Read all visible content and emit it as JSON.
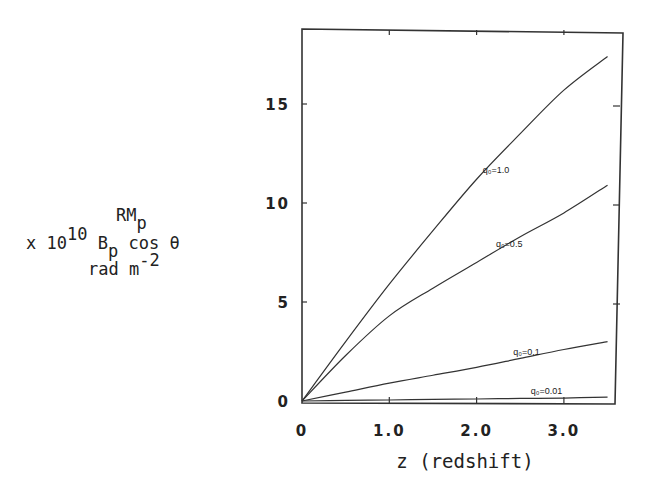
{
  "chart_data": {
    "type": "line",
    "title": "",
    "xlabel": "z (redshift)",
    "ylabel": {
      "line1": "RM",
      "line1_sub": "p",
      "line2_prefix": "x 10",
      "line2_sup": "10",
      "line2_B": "B",
      "line2_B_sub": "p",
      "line2_suffix": "cos θ",
      "line3": "rad m",
      "line3_sup": "-2"
    },
    "xlim": [
      0,
      3.5
    ],
    "ylim": [
      0,
      18.5
    ],
    "x_ticks": [
      0,
      1.0,
      2.0,
      3.0
    ],
    "x_tick_labels": [
      "0",
      "1.0",
      "2.0",
      "3.0"
    ],
    "y_ticks": [
      0,
      5,
      10,
      15
    ],
    "y_tick_labels": [
      "0",
      "5",
      "10",
      "15"
    ],
    "grid": false,
    "legend": "inline curve labels",
    "x": [
      0,
      0.5,
      1.0,
      1.5,
      2.0,
      2.5,
      3.0,
      3.5
    ],
    "series": [
      {
        "name": "q₀=1.0",
        "label": "q₀=1.0",
        "values": [
          0,
          3.0,
          5.9,
          8.6,
          11.2,
          13.5,
          15.7,
          17.4
        ]
      },
      {
        "name": "q₀=0.5",
        "label": "q₀=0.5",
        "values": [
          0,
          2.3,
          4.3,
          5.7,
          7.0,
          8.3,
          9.5,
          10.9
        ]
      },
      {
        "name": "q₀=0.1",
        "label": "q₀=0.1",
        "values": [
          0,
          0.45,
          0.9,
          1.3,
          1.7,
          2.15,
          2.6,
          3.0
        ]
      },
      {
        "name": "q₀=0.01",
        "label": "q₀=0.01",
        "values": [
          0,
          0.03,
          0.05,
          0.08,
          0.1,
          0.13,
          0.15,
          0.2
        ]
      }
    ],
    "label_positions": [
      {
        "series": "q₀=1.0",
        "x": 2.3,
        "y": 11.5
      },
      {
        "series": "q₀=0.5",
        "x": 2.45,
        "y": 7.8
      },
      {
        "series": "q₀=0.1",
        "x": 2.65,
        "y": 2.3
      },
      {
        "series": "q₀=0.01",
        "x": 2.85,
        "y": 0.35
      }
    ]
  }
}
